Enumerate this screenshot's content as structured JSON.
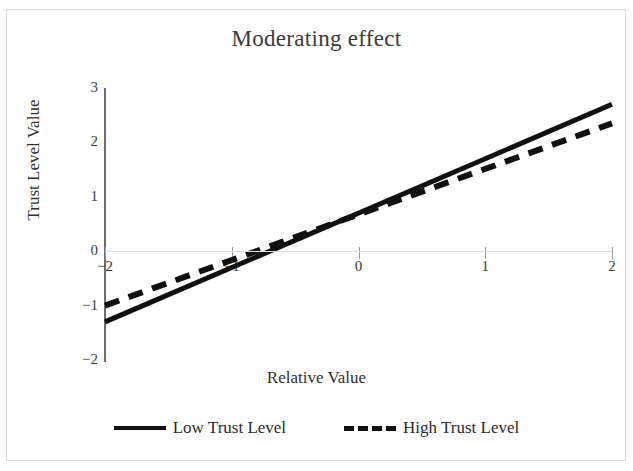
{
  "chart_data": {
    "type": "line",
    "title": "Moderating effect",
    "xlabel": "Relative Value",
    "ylabel": "Trust Level Value",
    "xlim": [
      -2,
      2
    ],
    "ylim": [
      -2,
      3
    ],
    "xticks": [
      "-2",
      "-1",
      "0",
      "1",
      "2"
    ],
    "xtick_values": [
      -2,
      -1,
      0,
      1,
      2
    ],
    "yticks": [
      "3",
      "2",
      "1",
      "0",
      "-1",
      "-2"
    ],
    "ytick_values": [
      3,
      2,
      1,
      0,
      -1,
      -2
    ],
    "grid": "horizontal-zero-line-only",
    "legend_position": "bottom-center",
    "x": [
      -2,
      2
    ],
    "series": [
      {
        "name": "Low Trust Level",
        "style": "solid",
        "color": "#111111",
        "values": [
          -1.3,
          2.7
        ],
        "slope": 1.0,
        "intercept": 0.7
      },
      {
        "name": "High Trust Level",
        "style": "dashed",
        "color": "#111111",
        "values": [
          -1.0,
          2.35
        ],
        "slope": 0.8375,
        "intercept": 0.675
      }
    ]
  },
  "figure": {
    "title": "Moderating effect",
    "axis_x_title": "Relative Value",
    "axis_y_title": "Trust Level Value"
  },
  "legend": {
    "items": [
      {
        "label": "Low Trust Level",
        "style": "solid"
      },
      {
        "label": "High Trust Level",
        "style": "dashed"
      }
    ]
  }
}
